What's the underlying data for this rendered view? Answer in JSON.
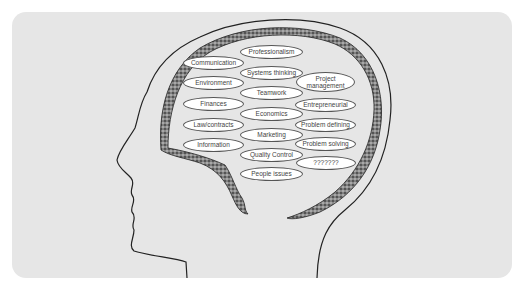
{
  "diagram": {
    "type": "head-brain-concept-map",
    "background_color": "#e6e6e6",
    "brain_texture_color": "#6f6f6f",
    "outline_color": "#222222",
    "bubbles": [
      {
        "label": "Professionalism",
        "x": 240,
        "y": 45,
        "w": 63,
        "h": 14
      },
      {
        "label": "Communication",
        "x": 183,
        "y": 56,
        "w": 61,
        "h": 14
      },
      {
        "label": "Systems thinking",
        "x": 240,
        "y": 66,
        "w": 63,
        "h": 14
      },
      {
        "label": "Project management",
        "x": 296,
        "y": 72,
        "w": 59,
        "h": 20
      },
      {
        "label": "Environment",
        "x": 183,
        "y": 76,
        "w": 61,
        "h": 14
      },
      {
        "label": "Teamwork",
        "x": 240,
        "y": 86,
        "w": 63,
        "h": 14
      },
      {
        "label": "Finances",
        "x": 183,
        "y": 97,
        "w": 61,
        "h": 14
      },
      {
        "label": "Entrepreneurial",
        "x": 295,
        "y": 98,
        "w": 61,
        "h": 14
      },
      {
        "label": "Economics",
        "x": 240,
        "y": 107,
        "w": 63,
        "h": 14
      },
      {
        "label": "Law/contracts",
        "x": 183,
        "y": 118,
        "w": 61,
        "h": 14
      },
      {
        "label": "Problem defining",
        "x": 295,
        "y": 118,
        "w": 61,
        "h": 14
      },
      {
        "label": "Marketing",
        "x": 240,
        "y": 128,
        "w": 63,
        "h": 14
      },
      {
        "label": "Information",
        "x": 183,
        "y": 138,
        "w": 61,
        "h": 14
      },
      {
        "label": "Problem solving",
        "x": 295,
        "y": 137,
        "w": 61,
        "h": 14
      },
      {
        "label": "Quality Control",
        "x": 240,
        "y": 148,
        "w": 63,
        "h": 14
      },
      {
        "label": "???????",
        "x": 296,
        "y": 156,
        "w": 60,
        "h": 14
      },
      {
        "label": "People issues",
        "x": 240,
        "y": 167,
        "w": 63,
        "h": 14
      }
    ]
  }
}
